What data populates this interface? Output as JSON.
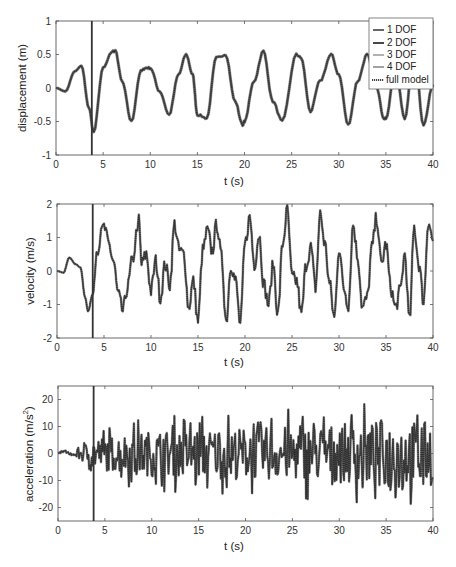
{
  "chart_data": [
    {
      "type": "line",
      "title": "",
      "xlabel": "t (s)",
      "ylabel": "displacement (m)",
      "xlim": [
        0,
        40
      ],
      "ylim": [
        -1,
        1
      ],
      "xticks": [
        "0",
        "5",
        "10",
        "15",
        "20",
        "25",
        "30",
        "35",
        "40"
      ],
      "yticks": [
        "1",
        "0.5",
        "0",
        "-0.5",
        "-1"
      ],
      "grid": false,
      "vertical_marker_t": 3.8,
      "legend": {
        "position": "upper right",
        "entries": [
          "1 DOF",
          "2 DOF",
          "3 DOF",
          "4 DOF",
          "full model"
        ]
      },
      "series": [
        {
          "name": "full model",
          "x": [
            0,
            1,
            2,
            2.7,
            3.5,
            4.0,
            5,
            6,
            6.3,
            7,
            8,
            9,
            9.5,
            10,
            11,
            12,
            13,
            13.8,
            14.5,
            15,
            16,
            17,
            18,
            19,
            19.8,
            20,
            21,
            22,
            23,
            24,
            25.5,
            26,
            27,
            28,
            29.2,
            30,
            31,
            32,
            33,
            34,
            34.8,
            35,
            36,
            37,
            38,
            39,
            40
          ],
          "y": [
            0,
            -0.05,
            0.25,
            0.33,
            -0.3,
            -0.65,
            0.3,
            0.55,
            0.55,
            0.1,
            -0.5,
            0.25,
            0.3,
            0.3,
            -0.05,
            -0.4,
            0.2,
            0.5,
            0.2,
            -0.4,
            -0.45,
            0.45,
            0.5,
            -0.2,
            -0.55,
            -0.5,
            0.1,
            0.55,
            -0.2,
            -0.5,
            0.5,
            0.45,
            -0.35,
            0.1,
            0.5,
            0.2,
            -0.55,
            0.1,
            0.5,
            0.0,
            -0.45,
            -0.45,
            0.3,
            -0.45,
            0.55,
            -0.55,
            0.05
          ]
        }
      ]
    },
    {
      "type": "line",
      "title": "",
      "xlabel": "t (s)",
      "ylabel": "velocity (m/s)",
      "xlim": [
        0,
        40
      ],
      "ylim": [
        -2,
        2
      ],
      "xticks": [
        "0",
        "5",
        "10",
        "15",
        "20",
        "25",
        "30",
        "35",
        "40"
      ],
      "yticks": [
        "2",
        "1",
        "0",
        "-1",
        "-2"
      ],
      "grid": false,
      "vertical_marker_t": 3.8,
      "series": [
        {
          "name": "full model",
          "x": [
            0,
            0.7,
            1.3,
            2,
            2.5,
            3,
            3.3,
            3.8,
            4.2,
            5,
            5.5,
            6,
            6.5,
            7,
            7.5,
            8,
            8.7,
            9,
            9.5,
            10,
            10.5,
            11,
            11.5,
            12,
            12.5,
            13,
            13.5,
            14,
            14.5,
            15,
            15.5,
            16,
            16.5,
            17,
            17.5,
            18,
            18.5,
            19,
            19.5,
            20,
            20.5,
            21,
            21.5,
            22,
            22.5,
            23,
            23.5,
            24,
            24.5,
            25,
            25.5,
            26,
            26.5,
            27,
            27.5,
            28,
            28.5,
            29,
            29.5,
            30,
            30.5,
            31,
            31.5,
            32,
            32.5,
            33,
            33.5,
            34,
            34.5,
            35,
            35.5,
            36,
            36.5,
            37,
            37.5,
            38,
            38.5,
            39,
            39.5,
            40
          ],
          "y": [
            0,
            -0.05,
            0.4,
            0.2,
            0.1,
            -0.8,
            -1.2,
            -0.7,
            0.6,
            1.3,
            0.8,
            0.3,
            -0.7,
            -1.2,
            -0.5,
            0.3,
            1.5,
            0.2,
            0.5,
            -0.6,
            0.3,
            -0.8,
            0.2,
            -0.4,
            1.4,
            0.6,
            0.5,
            -1.1,
            -0.3,
            -1.5,
            0.6,
            1.2,
            0.6,
            1.4,
            0.4,
            -1.5,
            0.2,
            -0.3,
            -1.6,
            0.8,
            1.6,
            0.2,
            1.1,
            -0.4,
            -1.0,
            0.2,
            -1.3,
            0.8,
            1.8,
            -0.2,
            -0.3,
            -1.3,
            0.2,
            0.7,
            -0.5,
            1.7,
            0.8,
            -0.4,
            -1.4,
            0.7,
            -0.5,
            -1.0,
            1.4,
            0.4,
            -1.1,
            -0.8,
            0.7,
            1.6,
            0.2,
            0.8,
            -0.5,
            -1.1,
            -0.6,
            0.5,
            -1.5,
            1.3,
            0.2,
            -0.9,
            1.5,
            0.9
          ]
        }
      ]
    },
    {
      "type": "line",
      "title": "",
      "xlabel": "t (s)",
      "ylabel": "acceleration (m/s²)",
      "xlim": [
        0,
        40
      ],
      "ylim": [
        -25,
        25
      ],
      "xticks": [
        "0",
        "5",
        "10",
        "15",
        "20",
        "25",
        "30",
        "35",
        "40"
      ],
      "yticks": [
        "20",
        "10",
        "0",
        "-10",
        "-20"
      ],
      "grid": false,
      "vertical_marker_t": 3.8,
      "series": [
        {
          "name": "full model",
          "amplitude_envelope": [
            [
              0,
              1
            ],
            [
              2,
              3
            ],
            [
              4,
              10
            ],
            [
              10,
              14
            ],
            [
              15,
              15
            ],
            [
              20,
              16
            ],
            [
              25,
              17
            ],
            [
              30,
              18
            ],
            [
              35,
              20
            ],
            [
              40,
              20
            ]
          ],
          "notes": "broadband oscillation, min approx -22 near t=36.9, max approx 18 near t=38"
        }
      ]
    }
  ],
  "axes_text": {
    "xlabel": "t (s)",
    "ylabel_disp": "displacement (m)",
    "ylabel_vel": "velocity (m/s)",
    "ylabel_acc_main": "acceleration  (m/s",
    "ylabel_acc_sup": "2",
    "ylabel_acc_end": ")",
    "xticks": [
      "0",
      "5",
      "10",
      "15",
      "20",
      "25",
      "30",
      "35",
      "40"
    ],
    "yticks_disp": [
      "1",
      "0.5",
      "0",
      "-0.5",
      "-1"
    ],
    "yticks_vel": [
      "2",
      "1",
      "0",
      "-1",
      "-2"
    ],
    "yticks_acc": [
      "20",
      "10",
      "0",
      "-10",
      "-20"
    ]
  },
  "legend": {
    "entries": [
      {
        "label": "1 DOF",
        "color": "#555555",
        "style": "solid"
      },
      {
        "label": "2 DOF",
        "color": "#333333",
        "style": "solid"
      },
      {
        "label": "3 DOF",
        "color": "#aaaaaa",
        "style": "solid"
      },
      {
        "label": "4 DOF",
        "color": "#999999",
        "style": "solid"
      },
      {
        "label": "full model",
        "color": "#444444",
        "style": "dotted"
      }
    ]
  },
  "colors": {
    "axes": "#555555",
    "marker_line": "#333333",
    "trace": "#3a3a3a"
  }
}
